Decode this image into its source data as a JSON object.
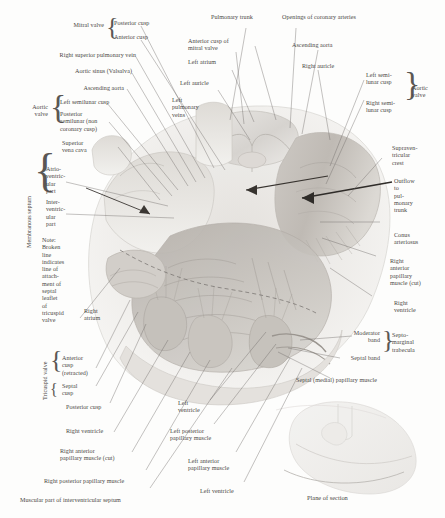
{
  "plate": {
    "title": "Interior of the heart — plane of section",
    "background_color": "#fdfdfc",
    "ink_color": "#4a4744"
  },
  "labels": {
    "mitral_valve": "Mitral valve",
    "posterior_cusp": "Posterior cusp",
    "anterior_cusp": "Anterior cusp",
    "right_superior_pulmonary_vein": "Right superior pulmonary vein",
    "aortic_sinus": "Aortic sinus (Valsalva)",
    "ascending_aorta_left": "Ascending aorta",
    "aortic_valve_left": "Aortic\nvalve",
    "left_semilunar_cusp_left": "Left semilunar cusp",
    "posterior_semilunar_cusp": "Posterior\nsemilunar (non\ncoronary cusp)",
    "superior_vena_cava": "Superior\nvena cava",
    "membranous_septum": "Membranous septum",
    "atrioventricular_part": "Atrio-\nventric-\nular\npart",
    "interventricular_part": "Inter-\nventric-\nular\npart",
    "note": "Note:\nBroken\nline\nindicates\nline of\nattach-\nment of\nseptal\nleaflet\nof\ntricuspid\nvalve",
    "right_atrium": "Right\natrium",
    "tricuspid_valve": "Tricuspid valve",
    "anterior_cusp_retracted": "Anterior\ncusp\n(retracted)",
    "septal_cusp": "Septal\ncusp",
    "posterior_cusp_tricuspid": "Posterior cusp",
    "right_ventricle_bottom": "Right ventricle",
    "right_anterior_papillary_cut_bottom": "Right anterior\npapillary muscle (cut)",
    "right_posterior_papillary": "Right posterior papillary muscle",
    "muscular_part_ivs": "Muscular part of interventricular septum",
    "pulmonary_trunk": "Pulmonary trunk",
    "anterior_cusp_of_mitral_valve": "Anterior cusp of\nmitral valve",
    "left_atrium": "Left atrium",
    "left_auricle": "Left auricle",
    "left_pulmonary_veins": "Left\npulmonary\nveins",
    "openings_of_coronary_arteries": "Openings of coronary arteries",
    "ascending_aorta_right": "Ascending aorta",
    "right_auricle": "Right auricle",
    "left_semilunar_cusp_right": "Left semi-\nlunar cusp",
    "right_semilunar_cusp": "Right semi-\nlunar cusp",
    "aortic_valve_right": "Aortic\nvalve",
    "supraventricular_crest": "Supraven-\ntricular\ncrest",
    "outflow_to_pulmonary_trunk": "Outflow\nto\npul-\nmonary\ntrunk",
    "conus_arteriosus": "Conus\narteriosus",
    "right_anterior_papillary_cut_right": "Right\nanterior\npapillary\nmuscle (cut)",
    "right_ventricle_right": "Right\nventricle",
    "moderator_band": "Moderator\nband",
    "septal_band": "Septal band",
    "septomarginal_trabecula": "Septo-\nmarginal\ntrabecula",
    "septal_medial_papillary_muscle": "Septal (medial) papillary muscle",
    "left_ventricle_upper": "Left\nventricle",
    "left_posterior_papillary": "Left posterior\npapillary muscle",
    "left_anterior_papillary": "Left anterior\npapillary muscle",
    "left_ventricle_lower": "Left ventricle",
    "plane_of_section": "Plane of section"
  }
}
